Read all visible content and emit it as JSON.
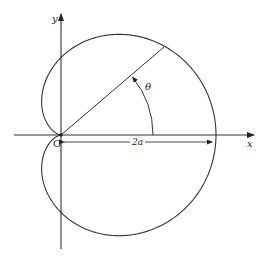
{
  "figure": {
    "type": "polar-curve",
    "curve": "cardioid",
    "equation": "r = a(1 + cos θ)",
    "labels": {
      "x_axis": "x",
      "y_axis": "y",
      "origin": "O",
      "angle": "θ",
      "span": "2a"
    },
    "colors": {
      "stroke": "#333333",
      "background": "#ffffff"
    }
  }
}
